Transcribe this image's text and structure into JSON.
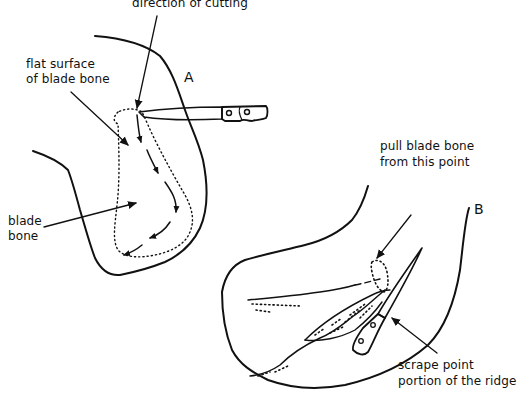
{
  "figure": {
    "panel_a": {
      "label": "A",
      "labels": {
        "direction": "direction of cutting",
        "flat_surface_line1": "flat surface",
        "flat_surface_line2": "of blade bone",
        "blade_bone_line1": "blade",
        "blade_bone_line2": "bone"
      }
    },
    "panel_b": {
      "label": "B",
      "labels": {
        "pull_line1": "pull blade bone",
        "pull_line2": "from this point",
        "scrape_line1": "scrape point",
        "scrape_line2": "portion of the ridge"
      }
    },
    "colors": {
      "ink": "#111111",
      "background": "#ffffff"
    }
  }
}
